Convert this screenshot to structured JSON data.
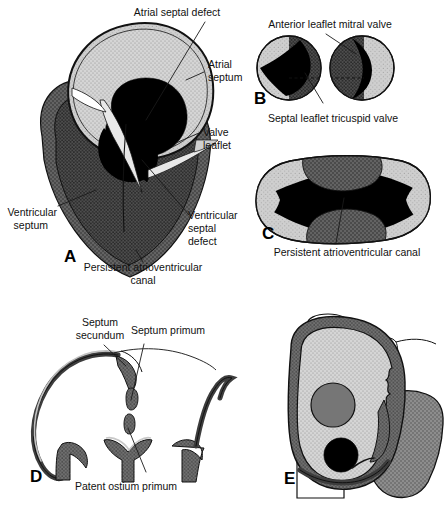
{
  "figure": {
    "width": 446,
    "height": 506,
    "background": "#ffffff"
  },
  "palette": {
    "black": "#000000",
    "ink": "#111111",
    "light_stipple": "#c9c9c9",
    "mid_gray": "#8f8f8f",
    "dark_stipple": "#5f5f5f",
    "darker_stipple": "#4a4a4a",
    "wall_gray": "#6b6b6b",
    "pale": "#d8d8d8",
    "white": "#ffffff"
  },
  "panels": [
    {
      "id": "A",
      "letter": "A",
      "caption_lines": [
        "Persistent atrioventricular",
        "canal"
      ],
      "labels": [
        {
          "name": "atrial-septal-defect",
          "text": "Atrial septal defect",
          "lines": [
            "Atrial septal defect"
          ]
        },
        {
          "name": "atrial-septum",
          "text": "Atrial septum",
          "lines": [
            "Atrial",
            "septum"
          ]
        },
        {
          "name": "valve-leaflet",
          "text": "Valve leaflet",
          "lines": [
            "Valve",
            "leaflet"
          ]
        },
        {
          "name": "ventricular-septum",
          "text": "Ventricular septum",
          "lines": [
            "Ventricular",
            "septum"
          ]
        },
        {
          "name": "ventricular-septal-defect",
          "text": "Ventricular septal defect",
          "lines": [
            "Ventricular",
            "septal",
            "defect"
          ]
        }
      ]
    },
    {
      "id": "B",
      "letter": "B",
      "labels": [
        {
          "name": "anterior-leaflet-mitral-valve",
          "text": "Anterior leaflet mitral valve",
          "lines": [
            "Anterior leaflet mitral valve"
          ]
        },
        {
          "name": "septal-leaflet-tricuspid-valve",
          "text": "Septal leaflet tricuspid valve",
          "lines": [
            "Septal leaflet tricuspid valve"
          ]
        }
      ]
    },
    {
      "id": "C",
      "letter": "C",
      "labels": [
        {
          "name": "persistent-atrioventricular-canal",
          "text": "Persistent atrioventricular canal",
          "lines": [
            "Persistent atrioventricular canal"
          ]
        }
      ]
    },
    {
      "id": "D",
      "letter": "D",
      "labels": [
        {
          "name": "septum-secundum",
          "text": "Septum secundum",
          "lines": [
            "Septum",
            "secundum"
          ]
        },
        {
          "name": "septum-primum",
          "text": "Septum primum",
          "lines": [
            "Septum primum"
          ]
        },
        {
          "name": "patent-ostium-primum",
          "text": "Patent ostium primum",
          "lines": [
            "Patent ostium primum"
          ]
        }
      ]
    },
    {
      "id": "E",
      "letter": "E",
      "labels": []
    }
  ],
  "text": {
    "atrial_septal_defect": "Atrial septal defect",
    "atrial_1": "Atrial",
    "atrial_2": "septum",
    "valve_1": "Valve",
    "valve_2": "leaflet",
    "vent_septum_1": "Ventricular",
    "vent_septum_2": "septum",
    "vsd_1": "Ventricular",
    "vsd_2": "septal",
    "vsd_3": "defect",
    "a_caption_1": "Persistent atrioventricular",
    "a_caption_2": "canal",
    "anterior_leaflet": "Anterior leaflet mitral valve",
    "septal_leaflet": "Septal leaflet tricuspid valve",
    "pac_c": "Persistent atrioventricular canal",
    "septum_secundum_1": "Septum",
    "septum_secundum_2": "secundum",
    "septum_primum": "Septum primum",
    "patent_ostium_primum": "Patent ostium primum",
    "letter_a": "A",
    "letter_b": "B",
    "letter_c": "C",
    "letter_d": "D",
    "letter_e": "E"
  }
}
